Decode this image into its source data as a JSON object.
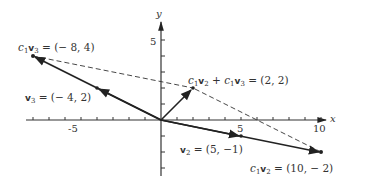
{
  "diagram": {
    "type": "vector-plot",
    "axes": {
      "x_label": "x",
      "y_label": "y",
      "x_ticks": [
        "-5",
        "5",
        "10"
      ],
      "y_ticks": [
        "5"
      ]
    },
    "vectors": [
      {
        "name": "v3",
        "from": [
          0,
          0
        ],
        "to": [
          -4,
          2
        ],
        "style": "solid"
      },
      {
        "name": "c1v3",
        "from": [
          0,
          0
        ],
        "to": [
          -8,
          4
        ],
        "style": "solid"
      },
      {
        "name": "v2",
        "from": [
          0,
          0
        ],
        "to": [
          5,
          -1
        ],
        "style": "solid"
      },
      {
        "name": "c1v2",
        "from": [
          0,
          0
        ],
        "to": [
          10,
          -2
        ],
        "style": "solid"
      },
      {
        "name": "sum",
        "from": [
          0,
          0
        ],
        "to": [
          2,
          2
        ],
        "style": "solid"
      }
    ],
    "dashed_lines": [
      {
        "from": [
          -8,
          4
        ],
        "to": [
          2,
          2
        ]
      },
      {
        "from": [
          10,
          -2
        ],
        "to": [
          2,
          2
        ]
      }
    ],
    "labels": {
      "c1v3": {
        "prefix": "c",
        "sub1": "1",
        "vec": "v",
        "sub2": "3",
        "value": " = (− 8,  4)"
      },
      "v3": {
        "vec": "v",
        "sub2": "3",
        "value": " = (− 4,  2)"
      },
      "sum": {
        "text1": "c",
        "sub1a": "1",
        "vec1": "v",
        "sub1b": "2",
        "plus": " + ",
        "text2": "c",
        "sub2a": "1",
        "vec2": "v",
        "sub2b": "3",
        "value": " = (2,  2)"
      },
      "v2": {
        "vec": "v",
        "sub2": "2",
        "value": " = (5,  −1)"
      },
      "c1v2": {
        "prefix": "c",
        "sub1": "1",
        "vec": "v",
        "sub2": "2",
        "value": " = (10,  − 2)"
      }
    }
  }
}
